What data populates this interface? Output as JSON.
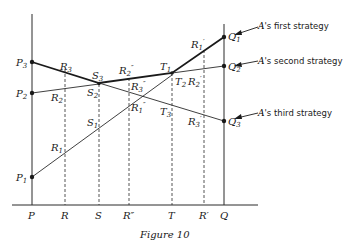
{
  "figure": {
    "caption": "Figure 10",
    "axis_labels": {
      "P": "P",
      "R": "R",
      "S": "S",
      "R2": "R″",
      "T": "T",
      "R1": "R′",
      "Q": "Q"
    },
    "endpoints": {
      "P1": "P",
      "P1_sub": "1",
      "P2": "P",
      "P2_sub": "2",
      "P3": "P",
      "P3_sub": "3",
      "Q1": "Q",
      "Q1_sub": "1",
      "Q2": "Q",
      "Q2_sub": "2",
      "Q3": "Q",
      "Q3_sub": "3"
    },
    "points": {
      "R1": "R",
      "R1_sub": "1",
      "R2": "R",
      "R2_sub": "2",
      "R3": "R",
      "R3_sub": "3",
      "S1": "S",
      "S1_sub": "1",
      "S2": "S",
      "S2_sub": "2",
      "S3": "S",
      "S3_sub": "3",
      "R1dd": "R",
      "R1dd_sub": "1",
      "R1dd_prime": "″",
      "R2dd": "R",
      "R2dd_sub": "2",
      "R2dd_prime": "″",
      "R3dd": "R",
      "R3dd_sub": "3",
      "R3dd_prime": "″",
      "T1": "T",
      "T1_sub": "1",
      "T2": "T",
      "T2_sub": "2",
      "T3": "T",
      "T3_sub": "3",
      "R1p": "R",
      "R1p_sub": "1",
      "R1p_prime": "′",
      "R2p": "R",
      "R2p_sub": "2",
      "R2p_prime": "′",
      "R3p": "R",
      "R3p_sub": "3",
      "R3p_prime": "′"
    },
    "annotations": {
      "first": {
        "a": "A",
        "rest": "'s first strategy"
      },
      "second": {
        "a": "A",
        "rest": "'s second strategy"
      },
      "third": {
        "a": "A",
        "rest": "'s third strategy"
      }
    },
    "lines": [
      {
        "name": "A's first strategy",
        "from": "P1",
        "to": "Q1"
      },
      {
        "name": "A's second strategy",
        "from": "P2",
        "to": "Q2"
      },
      {
        "name": "A's third strategy",
        "from": "P3",
        "to": "Q3"
      }
    ],
    "upper_envelope": [
      "P3",
      "S3",
      "T1",
      "Q1"
    ]
  }
}
